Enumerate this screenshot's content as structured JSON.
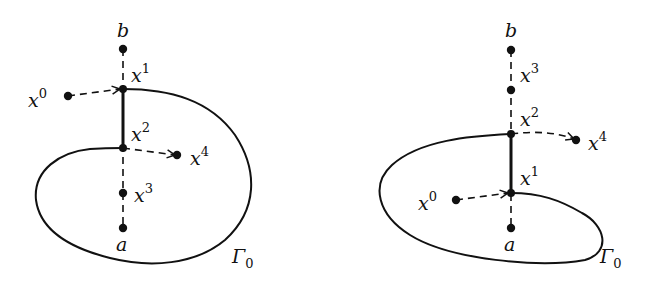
{
  "figure": {
    "panels": [
      {
        "id": "left",
        "labels": {
          "b": "b",
          "a": "a",
          "x0": "x",
          "x0_sup": "0",
          "x1": "x",
          "x1_sup": "1",
          "x2": "x",
          "x2_sup": "2",
          "x3": "x",
          "x3_sup": "3",
          "x4": "x",
          "x4_sup": "4",
          "gamma": "Γ",
          "gamma_sub": "0"
        },
        "order_on_segment_top_to_bottom": [
          "b",
          "x1",
          "x2",
          "x3",
          "a"
        ]
      },
      {
        "id": "right",
        "labels": {
          "b": "b",
          "a": "a",
          "x0": "x",
          "x0_sup": "0",
          "x1": "x",
          "x1_sup": "1",
          "x2": "x",
          "x2_sup": "2",
          "x3": "x",
          "x3_sup": "3",
          "x4": "x",
          "x4_sup": "4",
          "gamma": "Γ",
          "gamma_sub": "0"
        },
        "order_on_segment_top_to_bottom": [
          "b",
          "x3",
          "x2",
          "x1",
          "a"
        ]
      }
    ],
    "colors": {
      "ink": "#111111",
      "background": "#ffffff"
    }
  }
}
